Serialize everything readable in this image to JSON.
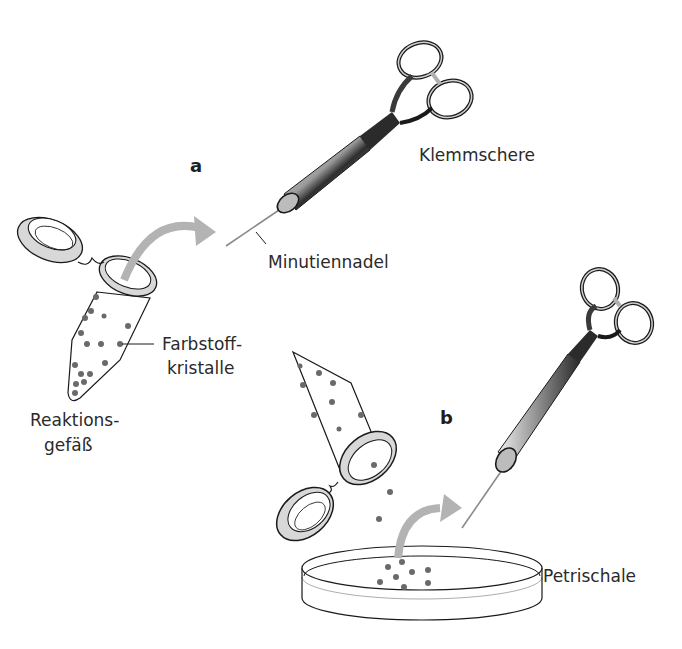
{
  "figure": {
    "panels": {
      "a": "a",
      "b": "b"
    },
    "labels": {
      "clamp_scissors": "Klemmschere",
      "minutien_pin": "Minutiennadel",
      "dye_crystals_line1": "Farbstoff-",
      "dye_crystals_line2": "kristalle",
      "reaction_tube_line1": "Reaktions-",
      "reaction_tube_line2": "gefäß",
      "petri_dish": "Petrischale"
    },
    "colors": {
      "arrow": "#b3b3b3",
      "crystal": "#6a6a6a",
      "outline": "#1a1a1a",
      "lid_fill": "#d6d6d6",
      "handle_dark": "#2b2b2b",
      "handle_light": "#e8e8e8"
    }
  }
}
